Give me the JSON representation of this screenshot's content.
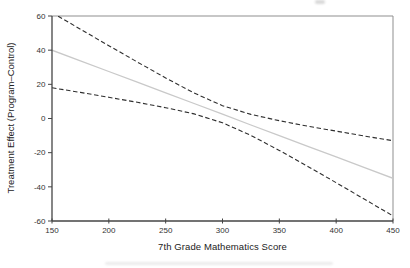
{
  "chart_data": {
    "type": "line",
    "title": "",
    "xlabel": "7th Grade Mathematics Score",
    "ylabel": "Treatment Effect (Program–Control)",
    "xlim": [
      150,
      450
    ],
    "ylim": [
      -60,
      60
    ],
    "x_ticks": [
      150,
      200,
      250,
      300,
      350,
      400,
      450
    ],
    "y_ticks": [
      60,
      40,
      20,
      0,
      -20,
      -40,
      -60
    ],
    "grid": false,
    "legend_position": "none",
    "x": [
      150,
      175,
      200,
      225,
      250,
      275,
      300,
      325,
      350,
      375,
      400,
      425,
      450
    ],
    "series": [
      {
        "name": "upper-confidence-bound",
        "style": "dashed",
        "color": "#2e2e2e",
        "width": 1.1,
        "values": [
          62.0,
          52.3,
          42.6,
          33.1,
          23.7,
          14.9,
          7.5,
          2.4,
          -1.3,
          -4.5,
          -7.4,
          -10.3,
          -13.0
        ]
      },
      {
        "name": "treatment-effect-estimate",
        "style": "solid",
        "color": "#c9c9c9",
        "width": 1.3,
        "values": [
          40.0,
          33.8,
          27.5,
          21.3,
          15.0,
          8.8,
          2.5,
          -3.8,
          -10.0,
          -16.3,
          -22.5,
          -28.8,
          -35.0
        ]
      },
      {
        "name": "lower-confidence-bound",
        "style": "dashed",
        "color": "#2e2e2e",
        "width": 1.1,
        "values": [
          18.0,
          15.3,
          12.4,
          9.5,
          6.3,
          2.7,
          -2.5,
          -9.9,
          -18.7,
          -28.1,
          -37.6,
          -47.3,
          -57.0
        ]
      }
    ],
    "axis_colors": {
      "primary": "#444444",
      "secondary": "#8f8f8f"
    },
    "text_color": "#333333"
  }
}
